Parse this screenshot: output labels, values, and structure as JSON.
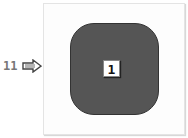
{
  "callout": {
    "number": "11",
    "arrow_icon": "right-arrow-icon"
  },
  "diagram": {
    "shape": "rounded-square",
    "shape_color": "#555555",
    "badge_label": "1"
  }
}
